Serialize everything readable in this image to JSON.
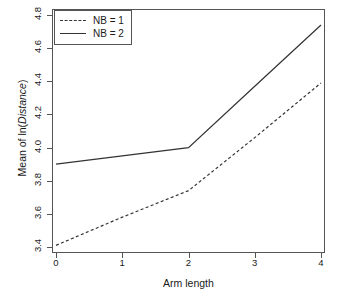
{
  "chart_data": {
    "type": "line",
    "title": "",
    "xlabel": "Arm length",
    "ylabel": "Mean of ln(Distance)",
    "ylabel_plain": "Mean of ln(",
    "ylabel_italic": "Distance",
    "ylabel_tail": ")",
    "x": [
      0,
      1,
      2,
      3,
      4
    ],
    "xlim": [
      0,
      4
    ],
    "ylim": [
      3.4,
      4.8
    ],
    "xticks": [
      "0",
      "1",
      "2",
      "3",
      "4"
    ],
    "yticks": [
      "3.4",
      "3.6",
      "3.8",
      "4.0",
      "4.2",
      "4.4",
      "4.6",
      "4.8"
    ],
    "ytick_values": [
      3.4,
      3.6,
      3.8,
      4.0,
      4.2,
      4.4,
      4.6,
      4.8
    ],
    "grid": false,
    "legend_position": "top-left",
    "series": [
      {
        "name": "NB = 1",
        "style": "dashed",
        "color": "#333333",
        "values": [
          3.41,
          3.58,
          3.74,
          4.06,
          4.39
        ]
      },
      {
        "name": "NB = 2",
        "style": "solid",
        "color": "#333333",
        "values": [
          3.9,
          3.95,
          4.0,
          4.37,
          4.74
        ]
      }
    ]
  }
}
